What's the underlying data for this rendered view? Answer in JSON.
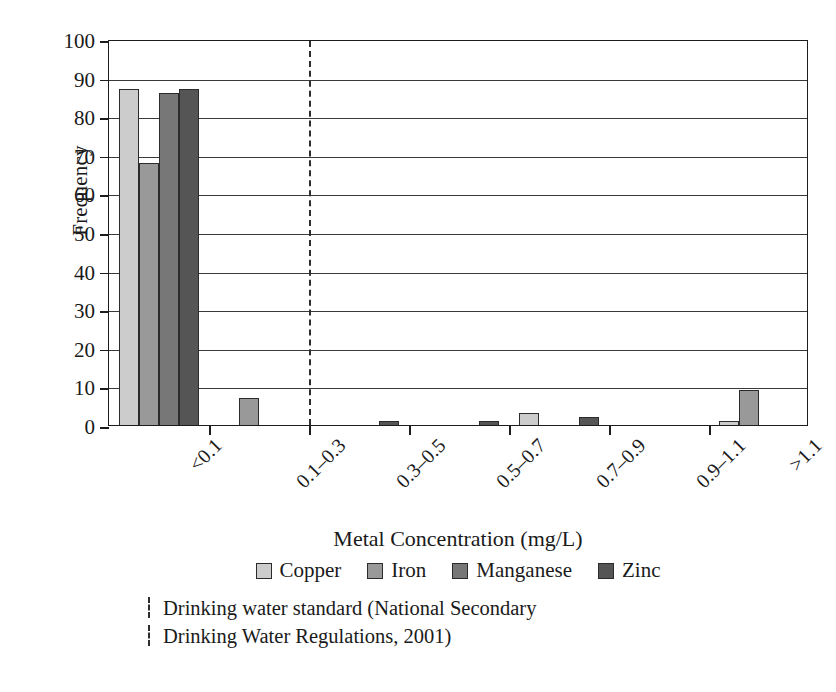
{
  "chart_data": {
    "type": "bar",
    "title": "",
    "xlabel": "Metal Concentration (mg/L)",
    "ylabel": "Frequency",
    "categories": [
      "<0.1",
      "0.1–0.3",
      "0.3–0.5",
      "0.5–0.7",
      "0.7–0.9",
      "0.9–1.1",
      ">1.1"
    ],
    "ylim": [
      0,
      100
    ],
    "yticks": [
      0,
      10,
      20,
      30,
      40,
      50,
      60,
      70,
      80,
      90,
      100
    ],
    "grid": "horizontal",
    "legend_position": "bottom",
    "series": [
      {
        "name": "Copper",
        "color": "#cccccc",
        "values": [
          87,
          0,
          0,
          0,
          3,
          0,
          1
        ]
      },
      {
        "name": "Iron",
        "color": "#999999",
        "values": [
          68,
          7,
          0,
          0,
          0,
          0,
          9
        ]
      },
      {
        "name": "Manganese",
        "color": "#777777",
        "values": [
          86,
          0,
          0,
          0,
          0,
          0,
          0
        ]
      },
      {
        "name": "Zinc",
        "color": "#555555",
        "values": [
          87,
          0,
          1,
          1,
          2,
          0,
          0
        ]
      }
    ],
    "annotations": [
      {
        "type": "vline",
        "style": "dashed",
        "at_category_boundary": 2,
        "label_line1": "Drinking water standard (National Secondary",
        "label_line2": "Drinking Water Regulations, 2001)"
      }
    ]
  },
  "axis": {
    "y_title": "Frequency",
    "x_title": "Metal Concentration (mg/L)",
    "y_tick_labels": [
      "100",
      "90",
      "80",
      "70",
      "60",
      "50",
      "40",
      "30",
      "20",
      "10",
      "0"
    ],
    "x_tick_labels": [
      "<0.1",
      "0.1–0.3",
      "0.3–0.5",
      "0.5–0.7",
      "0.7–0.9",
      "0.9–1.1",
      ">1.1"
    ]
  },
  "legend": {
    "items": [
      {
        "label": "Copper",
        "color": "#cccccc"
      },
      {
        "label": "Iron",
        "color": "#999999"
      },
      {
        "label": "Manganese",
        "color": "#777777"
      },
      {
        "label": "Zinc",
        "color": "#555555"
      }
    ]
  },
  "footnote": {
    "line1": "Drinking water standard (National Secondary",
    "line2": "Drinking Water Regulations, 2001)"
  },
  "colors": {
    "axis": "#1c1c1c",
    "grid": "#3a3a3a",
    "background": "#ffffff",
    "dashed_line": "#2d2d2d"
  }
}
